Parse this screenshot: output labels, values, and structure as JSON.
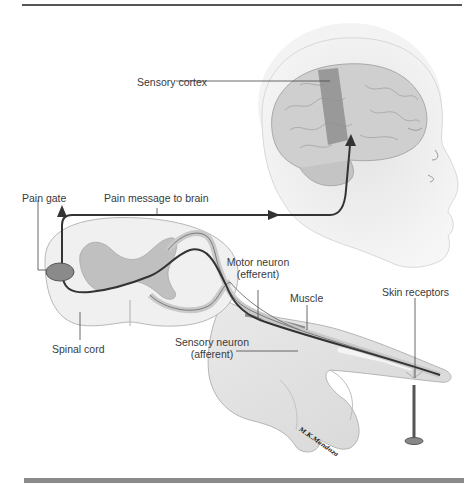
{
  "figure": {
    "labels": {
      "sensory_cortex": "Sensory cortex",
      "pain_gate": "Pain gate",
      "pain_message": "Pain message to brain",
      "motor_neuron_line1": "Motor neuron",
      "motor_neuron_line2": "(efferent)",
      "muscle": "Muscle",
      "sensory_neuron_line1": "Sensory neuron",
      "sensory_neuron_line2": "(afferent)",
      "skin_receptors": "Skin receptors",
      "spinal_cord": "Spinal cord"
    },
    "signature": "M.K.Mendoza",
    "colors": {
      "pathway": "#333333",
      "gray_matter": "#bdbdbd",
      "cortex_band": "#8f8f8f",
      "pain_gate_fill": "#8a8a8a",
      "skin": "#e6e6e6",
      "bottom_rule": "#8a8a8a"
    }
  }
}
